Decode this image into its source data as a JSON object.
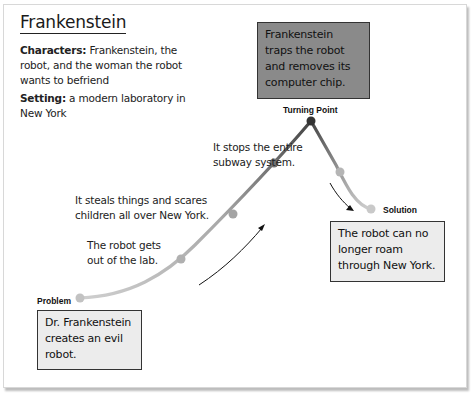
{
  "title": "Frankenstein",
  "characters": {
    "label": "Characters:",
    "text": " Frankenstein, the robot, and the woman the robot wants to befriend"
  },
  "setting": {
    "label": "Setting:",
    "text": " a modern laboratory in New York"
  },
  "plot": {
    "problem": {
      "label": "Problem",
      "text": "Dr. Frankenstein creates an evil robot."
    },
    "rising_events": [
      "The robot gets out of the lab.",
      "It steals things and scares children all over New York.",
      "It stops the entire subway system."
    ],
    "turning_point": {
      "label": "Turning Point",
      "text": "Frankenstein traps the robot and removes its computer chip."
    },
    "solution": {
      "label": "Solution",
      "text": "The robot can no longer roam through New York."
    }
  },
  "colors": {
    "curve_light": "#c4c4c4",
    "curve_dark": "#555555",
    "dot_light": "#b9b9b9",
    "dot_mid": "#7a7a7a",
    "dot_dark": "#333333",
    "box_light": "#ececec",
    "box_dark": "#8a8a8a"
  }
}
